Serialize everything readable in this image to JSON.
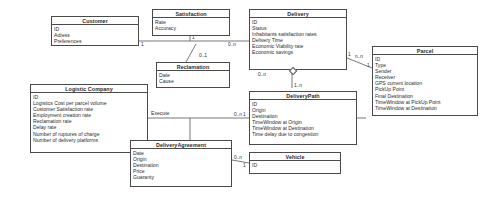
{
  "diagram": {
    "type": "uml-class-diagram",
    "title": "",
    "classes": [
      {
        "id": "customer",
        "name": "Customer",
        "attributes": [
          "ID",
          "Adress",
          "Preferences"
        ]
      },
      {
        "id": "satisfaction",
        "name": "Satisfaction",
        "attributes": [
          "Rate",
          "Accuracy"
        ]
      },
      {
        "id": "delivery",
        "name": "Delivery",
        "attributes": [
          "ID",
          "Status",
          "Inhabitants satisfaction rates",
          "Delivery Time",
          "Economic Viability rate",
          "Economic savings"
        ]
      },
      {
        "id": "parcel",
        "name": "Parcel",
        "attributes": [
          "ID",
          "Type",
          "Sender",
          "Receiver",
          "GPS current location",
          "PickUp Point",
          "Final Destination",
          "TimeWindow at PickUp Point",
          "TimeWindow at Destination"
        ]
      },
      {
        "id": "reclamation",
        "name": "Reclamation",
        "attributes": [
          "Date",
          "Cause"
        ]
      },
      {
        "id": "logistic-company",
        "name": "Logistic Company",
        "attributes": [
          "ID",
          "Logistics Cost per parcel volume",
          "Customer Satisfaction rate",
          "Employment creation rate",
          "Reclamation rate",
          "Delay rate",
          "Number of ruptures of charge",
          "Number of delivery platforms"
        ]
      },
      {
        "id": "delivery-path",
        "name": "DeliveryPath",
        "attributes": [
          "ID",
          "Origin",
          "Destination",
          "TimeWindow at Origin",
          "TimeWindow at Destination",
          "Time delay due to congestion"
        ]
      },
      {
        "id": "delivery-agreement",
        "name": "DeliveryAgreement",
        "attributes": [
          "Date",
          "Origin",
          "Destination",
          "Price",
          "Guaranty"
        ]
      },
      {
        "id": "vehicle",
        "name": "Vehicle",
        "attributes": [
          "ID"
        ]
      }
    ],
    "multiplicities": {
      "customer_right": "1",
      "satisfaction_bottom": "1",
      "reclamation_top": "0..1",
      "delivery_left": "0..n",
      "delivery_right": "1",
      "delivery_parcel": "n..n",
      "delivery_bottom": "0..n",
      "delivery_path_top": "1..n",
      "parcel_left": "1",
      "delivery_path_left": "1",
      "delivery_path_agreement": "0..n",
      "delivery_agreement_right": "0..n",
      "vehicle_left": "1"
    },
    "edge_labels": {
      "execute": "Execute"
    },
    "colors": {
      "stroke": "#4a4a4a",
      "text": "#2b2b2b",
      "background": "#ffffff"
    }
  }
}
